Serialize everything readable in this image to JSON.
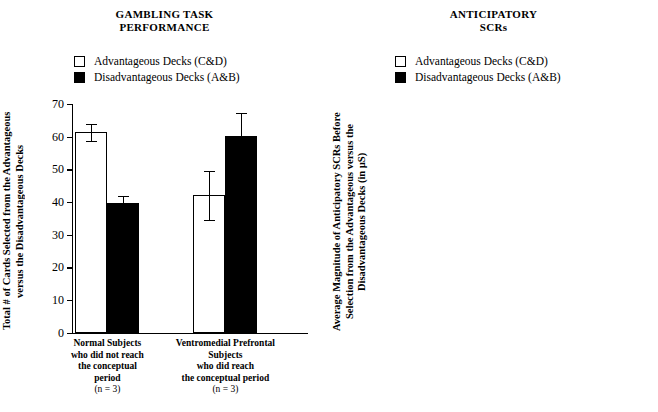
{
  "figure": {
    "legend_items": [
      {
        "key": "advantageous",
        "label": "Advantageous Decks (C&D)",
        "swatch": "open-square-icon",
        "color": "#ffffff"
      },
      {
        "key": "disadvantageous",
        "label": "Disadvantageous Decks (A&B)",
        "swatch": "filled-square-icon",
        "color": "#000000"
      }
    ]
  },
  "chart_data": [
    {
      "type": "bar",
      "id": "gambling-task-performance",
      "title": "GAMBLING TASK PERFORMANCE",
      "title_lines": [
        "GAMBLING TASK",
        "PERFORMANCE"
      ],
      "ylabel": "Total # of Cards Selected from the Advantageous versus the Disadvantageous Decks",
      "xlabel": "",
      "ylim": [
        0,
        70
      ],
      "ytick_step": 10,
      "yticks": [
        0,
        10,
        20,
        30,
        40,
        50,
        60,
        70
      ],
      "ytick_labels": [
        "0",
        "10",
        "20",
        "30",
        "40",
        "50",
        "60",
        "70"
      ],
      "grid": false,
      "legend_position": "above-plot",
      "categories": [
        "Normal Subjects who did not reach the conceptual period (n = 3)",
        "Ventromedial Prefrontal Subjects who did reach the conceptual period (n = 3)"
      ],
      "category_lines": [
        [
          "Normal Subjects",
          "who did not reach",
          "the conceptual",
          "period",
          "(n = 3)"
        ],
        [
          "Ventromedial Prefrontal",
          "Subjects",
          "who did reach",
          "the conceptual period",
          "(n = 3)"
        ]
      ],
      "series": [
        {
          "name": "Advantageous Decks (C&D)",
          "fill": "open",
          "values": [
            61.3,
            42.0
          ],
          "errors": [
            2.7,
            7.5
          ]
        },
        {
          "name": "Disadvantageous Decks (A&B)",
          "fill": "filled",
          "values": [
            39.7,
            60.3
          ],
          "errors": [
            2.2,
            7.0
          ]
        }
      ]
    },
    {
      "type": "bar",
      "id": "anticipatory-scrs",
      "title": "ANTICIPATORY SCRs",
      "title_lines": [
        "ANTICIPATORY",
        "SCRs"
      ],
      "ylabel": "Average Magnitude of Anticipatory SCRs Before Selection from the Advantageous versus the Disadvantageous Decks (in µS)",
      "xlabel": "",
      "ylim": [
        0,
        0.95
      ],
      "ytick_step": 0.1,
      "yticks": [
        0,
        0.1,
        0.2,
        0.3,
        0.4,
        0.5,
        0.6,
        0.7,
        0.8,
        0.9
      ],
      "ytick_labels": [
        "0",
        "0.1",
        "0.2",
        "0.3",
        "0.4",
        "0.5",
        "0.6",
        "0.7",
        "0.8",
        "0.9"
      ],
      "grid": false,
      "legend_position": "above-plot",
      "categories": [
        "Normal Subjects who did not reach the conceptual period (n = 3)",
        "Ventromedial Prefrontal Subjects who did reach the conceptual period (n = 3)"
      ],
      "category_lines": [
        [
          "Normal Subjects",
          "who did not reach",
          "the conceptual",
          "period",
          "(n = 3)"
        ],
        [
          "Ventromedial Prefrontal",
          "Subjects",
          "who did reach",
          "the conceptual period",
          "(n = 3)"
        ]
      ],
      "series": [
        {
          "name": "Advantageous Decks (C&D)",
          "fill": "open",
          "values": [
            0.59,
            0.05
          ],
          "errors": [
            0.245,
            0.035
          ]
        },
        {
          "name": "Disadvantageous Decks (A&B)",
          "fill": "filled",
          "values": [
            0.73,
            0.045
          ],
          "errors": [
            0.23,
            0.03
          ]
        }
      ]
    }
  ]
}
